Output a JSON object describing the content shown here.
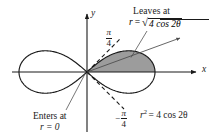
{
  "figure": {
    "kind": "polar-curve-diagram",
    "curve_name": "lemniscate",
    "background_color": "#ffffff",
    "ink_color": "#1a1a1a",
    "shade_color": "#9c9c9c"
  },
  "axes": {
    "y_label": "y",
    "x_label": "x"
  },
  "annotations": {
    "leaves": {
      "title": "Leaves at",
      "eq_lhs": "r",
      "eq_sign": "=",
      "radical_symbol": "√",
      "radicand": "4 cos 2θ"
    },
    "enters": {
      "title": "Enters at",
      "eq": "r = 0"
    },
    "curve_equation": {
      "base": "r",
      "exponent": "2",
      "rest": "= 4 cos 2θ"
    },
    "angle_upper": {
      "sign": "",
      "numerator": "π",
      "denominator": "4"
    },
    "angle_lower": {
      "sign": "−",
      "numerator": "π",
      "denominator": "4"
    }
  },
  "chart_data": {
    "type": "line",
    "title": "",
    "xlabel": "x",
    "ylabel": "y",
    "curve_equation_polar": "r^2 = 4 cos 2θ",
    "r_of_theta": "r = sqrt(4 cos 2θ)",
    "theta_range_right_lobe_deg": [
      -45,
      45
    ],
    "theta_range_left_lobe_deg": [
      135,
      225
    ],
    "a_squared": 4,
    "max_r": 2,
    "shaded_region": {
      "description": "upper half of right lobe",
      "theta_from": 0,
      "theta_to": 0.7853981634,
      "theta_to_label": "π/4",
      "enters_at_r": 0,
      "leaves_at_r": "sqrt(4 cos 2θ)"
    },
    "rays": [
      {
        "angle_deg": 45,
        "style": "dashed",
        "label": "π/4"
      },
      {
        "angle_deg": -45,
        "style": "dashed",
        "label": "−π/4"
      },
      {
        "angle_deg": 20,
        "style": "solid-arrow",
        "label": ""
      }
    ],
    "grid": false,
    "legend": "none",
    "xlim": [
      -2.4,
      2.4
    ],
    "ylim": [
      -1.2,
      1.2
    ]
  }
}
